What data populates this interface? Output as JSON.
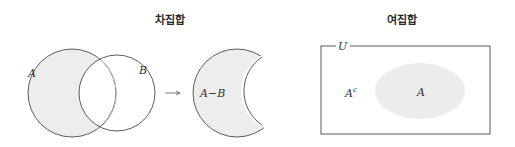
{
  "panels": [
    {
      "title": "차집합",
      "labels": {
        "set_a": "A",
        "set_b": "B",
        "result": "A−B"
      },
      "arrow": "→"
    },
    {
      "title": "여집합",
      "labels": {
        "universe": "U",
        "complement": "A",
        "complement_sup": "c",
        "set_a": "A"
      }
    }
  ],
  "colors": {
    "stroke": "#4a4a4a",
    "fill_shade": "#ececec",
    "background": "#ffffff"
  }
}
